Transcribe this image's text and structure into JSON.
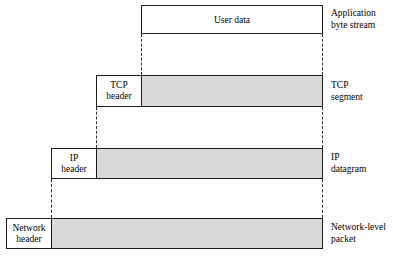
{
  "diagram": {
    "colors": {
      "payload_shade": "#d9d9d9",
      "box_border": "#1a1a1a",
      "dash_line": "#2a2a2a",
      "background": "#ffffff"
    },
    "layers": [
      {
        "id": "application",
        "header_label": "",
        "payload_label": "User data",
        "side_label_line1": "Application",
        "side_label_line2": "byte stream",
        "shaded": false
      },
      {
        "id": "tcp",
        "header_label_line1": "TCP",
        "header_label_line2": "header",
        "payload_label": "",
        "side_label_line1": "TCP",
        "side_label_line2": "segment",
        "shaded": true
      },
      {
        "id": "ip",
        "header_label_line1": "IP",
        "header_label_line2": "header",
        "payload_label": "",
        "side_label_line1": "IP",
        "side_label_line2": "datagram",
        "shaded": true
      },
      {
        "id": "network",
        "header_label_line1": "Network",
        "header_label_line2": "header",
        "payload_label": "",
        "side_label_line1": "Network-level",
        "side_label_line2": "packet",
        "shaded": true
      }
    ]
  }
}
